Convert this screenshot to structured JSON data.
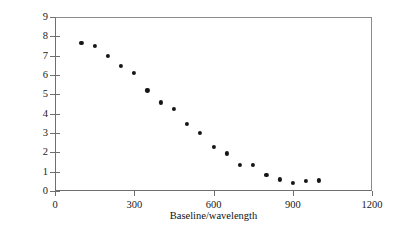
{
  "chart_data": {
    "type": "scatter",
    "title": "",
    "xlabel": "Baseline/wavelength",
    "ylabel": "Amplitude (Jy)",
    "xlim": [
      0,
      1200
    ],
    "ylim": [
      0,
      9
    ],
    "xticks": [
      0,
      300,
      600,
      900,
      1200
    ],
    "yticks": [
      0,
      1,
      2,
      3,
      4,
      5,
      6,
      7,
      8,
      9
    ],
    "xtick_labels": [
      "0",
      "300",
      "600",
      "900",
      "1200"
    ],
    "ytick_labels": [
      "0",
      "1",
      "2",
      "3",
      "4",
      "5",
      "6",
      "7",
      "8",
      "9"
    ],
    "grid": false,
    "legend": null,
    "marker": "filled-circle",
    "marker_color": "#151515",
    "series": [
      {
        "name": "visibility amplitude",
        "points": [
          [
            100,
            7.65
          ],
          [
            150,
            7.52
          ],
          [
            200,
            7.0
          ],
          [
            250,
            6.48
          ],
          [
            300,
            6.12
          ],
          [
            350,
            5.2
          ],
          [
            400,
            4.58
          ],
          [
            450,
            4.26
          ],
          [
            500,
            3.46
          ],
          [
            550,
            3.02
          ],
          [
            600,
            2.28
          ],
          [
            650,
            1.94
          ],
          [
            700,
            1.35
          ],
          [
            750,
            1.37
          ],
          [
            800,
            0.83
          ],
          [
            850,
            0.6
          ],
          [
            900,
            0.43
          ],
          [
            950,
            0.52
          ],
          [
            1000,
            0.55
          ]
        ]
      }
    ]
  },
  "axis_colors": {
    "frame": "#6f6f6f",
    "frame_light": "#8c8c8c",
    "text": "#111111",
    "marker": "#151515"
  }
}
